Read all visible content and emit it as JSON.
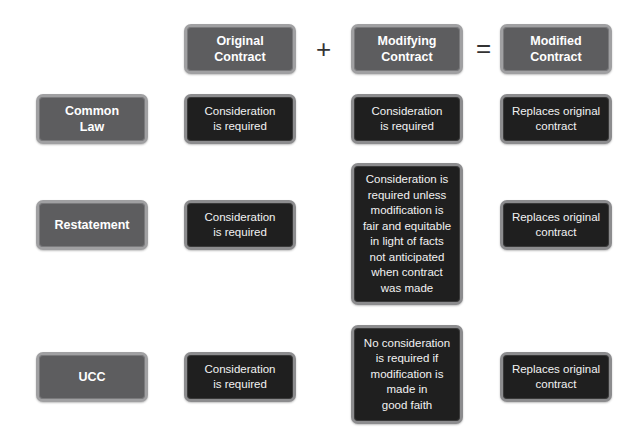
{
  "headers": {
    "original": "Original\nContract",
    "modifying": "Modifying\nContract",
    "modified": "Modified\nContract"
  },
  "operators": {
    "plus": "+",
    "equals": "="
  },
  "rows": [
    {
      "label": "Common\nLaw",
      "original": "Consideration\nis required",
      "modifying": "Consideration\nis required",
      "modified": "Replaces original\ncontract"
    },
    {
      "label": "Restatement",
      "original": "Consideration\nis required",
      "modifying": "Consideration is\nrequired unless\nmodification is\nfair and equitable\nin light of facts\nnot anticipated\nwhen contract\nwas made",
      "modified": "Replaces original\ncontract"
    },
    {
      "label": "UCC",
      "original": "Consideration\nis required",
      "modifying": "No consideration\nis required if\nmodification is\nmade in\ngood faith",
      "modified": "Replaces original\ncontract"
    }
  ],
  "colors": {
    "header_fill": "#5d5d5f",
    "cell_fill": "#1f1f1f",
    "border": "#a0a0a2"
  }
}
